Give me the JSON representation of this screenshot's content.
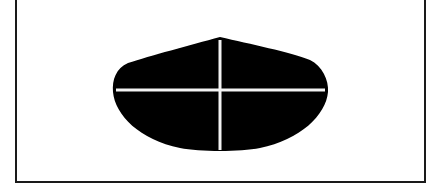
{
  "diagram": {
    "type": "shape-with-crosshair",
    "frame": {
      "border_color": "#1a1a1a",
      "background": "#ffffff"
    },
    "shape": {
      "description": "black teardrop/bell-shaped lens with pointed top and rounded bottom",
      "fill": "#000000",
      "peak": [
        220,
        37
      ],
      "left": 113,
      "right": 328,
      "bottom": 152
    },
    "crosshair": {
      "color": "#f2f2f2",
      "horizontal": {
        "y": 90,
        "x1": 116,
        "x2": 325
      },
      "vertical": {
        "x": 220,
        "y1": 40,
        "y2": 150
      }
    }
  }
}
